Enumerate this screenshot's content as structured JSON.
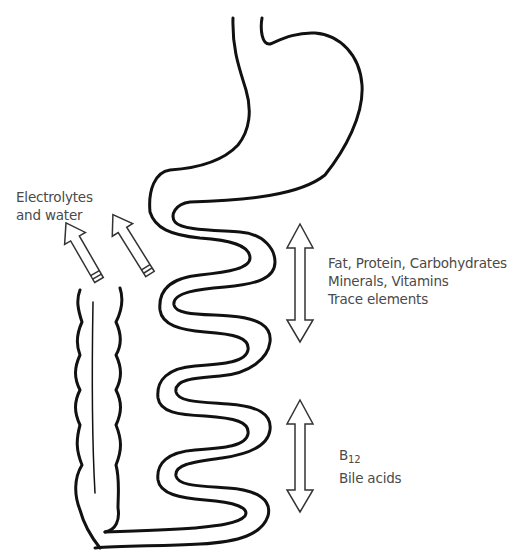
{
  "diagram": {
    "colors": {
      "outline": "#111111",
      "arrow": "#333333",
      "text": "#4a4a4a",
      "background": "#ffffff"
    },
    "organs": [
      {
        "name": "stomach"
      },
      {
        "name": "small-intestine"
      },
      {
        "name": "colon"
      }
    ],
    "labels": {
      "colon_absorption": {
        "line1": "Electrolytes",
        "line2": "and water"
      },
      "upper_absorption": {
        "line1": "Fat, Protein, Carbohydrates",
        "line2": "Minerals, Vitamins",
        "line3": "Trace elements"
      },
      "lower_absorption": {
        "b12_main": "B",
        "b12_sub": "12",
        "line2": "Bile acids"
      }
    }
  }
}
